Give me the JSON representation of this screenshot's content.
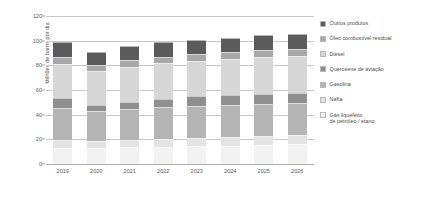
{
  "chart_data": {
    "type": "bar",
    "subtype": "stacked-column",
    "title": "",
    "xlabel": "",
    "ylabel": "Milhões de barris por dia",
    "ylim": [
      0,
      120
    ],
    "yticks": [
      0,
      20,
      40,
      60,
      80,
      100,
      120
    ],
    "grid": true,
    "legend_position": "right",
    "categories": [
      "2019",
      "2020",
      "2021",
      "2022",
      "2023",
      "2024",
      "2025",
      "2026"
    ],
    "series": [
      {
        "name": "Gás liquefeito de petróleo / etano",
        "legend_label": "Gás liquefeito\nde petróleo / etano",
        "color": "#f2f2f2",
        "values": [
          13.0,
          13.2,
          13.8,
          13.8,
          14.5,
          15.0,
          15.6,
          16.5
        ]
      },
      {
        "name": "Nafta",
        "legend_label": "Nafta",
        "color": "#e3e3e3",
        "values": [
          6.2,
          5.3,
          6.0,
          6.3,
          6.6,
          6.8,
          7.1,
          7.0
        ]
      },
      {
        "name": "Gasolina",
        "legend_label": "Gasolina",
        "color": "#b4b4b4",
        "values": [
          26.3,
          24.2,
          25.2,
          26.0,
          26.3,
          26.2,
          26.0,
          26.0
        ]
      },
      {
        "name": "Querosene de aviação",
        "legend_label": "Querosene de aviação",
        "color": "#8f8f8f",
        "values": [
          7.7,
          5.0,
          5.5,
          7.0,
          7.6,
          7.9,
          8.2,
          8.5
        ]
      },
      {
        "name": "Diesel",
        "legend_label": "Diesel",
        "color": "#d6d6d6",
        "values": [
          28.3,
          27.4,
          28.5,
          28.7,
          28.5,
          29.1,
          29.6,
          29.3
        ]
      },
      {
        "name": "Óleo combustível residual",
        "legend_label": "Óleo combustível residual",
        "color": "#a8a8a8",
        "values": [
          5.2,
          5.2,
          5.1,
          5.2,
          5.4,
          5.5,
          5.6,
          5.8
        ]
      },
      {
        "name": "Outros produtos",
        "legend_label": "Outros produtos",
        "color": "#5b5b5b",
        "values": [
          12.1,
          10.5,
          11.4,
          11.8,
          12.0,
          12.0,
          12.3,
          12.3
        ]
      }
    ],
    "totals": [
      98.8,
      90.8,
      95.5,
      98.8,
      100.9,
      102.5,
      104.4,
      105.4
    ],
    "legend_order_top_to_bottom": [
      "Outros produtos",
      "Óleo combustível residual",
      "Diesel",
      "Querosene de aviação",
      "Gasolina",
      "Nafta",
      "Gás liquefeito de petróleo / etano"
    ]
  }
}
